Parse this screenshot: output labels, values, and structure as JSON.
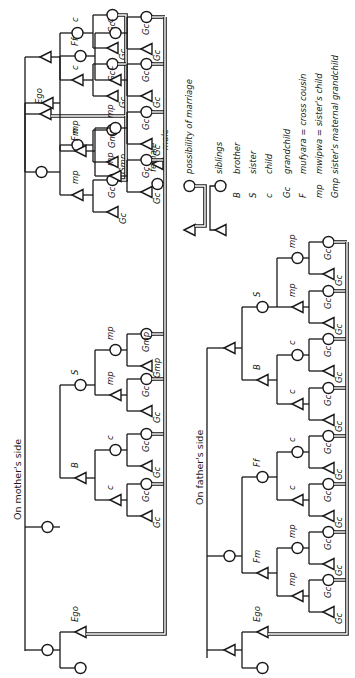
{
  "figure": {
    "orientation": "rotated-90-ccw",
    "ink_color": "#1a1a1a",
    "background": "#ffffff"
  },
  "legend": {
    "symbols": [
      {
        "symbol": "circle",
        "label": "female"
      },
      {
        "symbol": "triangle",
        "label": "male"
      },
      {
        "symbol": "double-line",
        "label": "possibility of marriage"
      },
      {
        "symbol": "single-line",
        "label": "siblings"
      }
    ],
    "abbreviations": [
      {
        "abbr": "B",
        "meaning": "brother"
      },
      {
        "abbr": "S",
        "meaning": "sister"
      },
      {
        "abbr": "c",
        "meaning": "child"
      },
      {
        "abbr": "Gc",
        "meaning": "grandchild"
      },
      {
        "abbr": "F",
        "meaning": "mufyara = cross cousin"
      },
      {
        "abbr": "mp",
        "meaning": "mwipwa = sister's child"
      },
      {
        "abbr": "Gmp",
        "meaning": "sister's maternal grandchild"
      }
    ]
  },
  "trees": {
    "example": {
      "title": "",
      "ego_label": "Ego",
      "labels": {
        "c1": "c",
        "c2": "c",
        "mp1": "mp",
        "mp2": "mp",
        "gc": "Gc",
        "gmp": "Gmp"
      }
    },
    "mother": {
      "title": "On mother's side",
      "ego_label": "Ego",
      "labels": {
        "B": "B",
        "S": "S",
        "Fm": "Fm",
        "Ff": "Ff",
        "c": "c",
        "mp": "mp",
        "gc": "Gc",
        "gmp": "Gmp"
      }
    },
    "father": {
      "title": "On father's side",
      "ego_label": "Ego",
      "labels": {
        "B": "B",
        "S": "S",
        "Fm": "Fm",
        "Ff": "Ff",
        "c": "c",
        "mp": "mp",
        "gc": "Gc"
      }
    }
  }
}
